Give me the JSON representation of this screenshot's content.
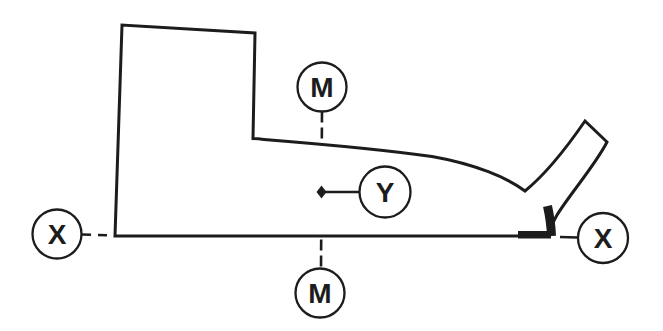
{
  "figure": {
    "kind": "technical-line-diagram",
    "description_labels_only": true,
    "callouts": {
      "moment_axis_top": "M",
      "moment_axis_bottom": "M",
      "x_axis_left": "X",
      "x_axis_right": "X",
      "reference_point": "Y"
    },
    "colors": {
      "ink": "#1c1c1c",
      "paper": "#ffffff"
    }
  }
}
